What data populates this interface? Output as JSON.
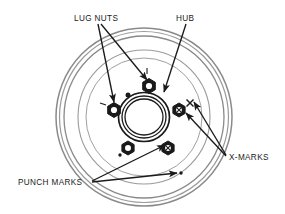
{
  "diagram": {
    "type": "brake-drum-technical-illustration",
    "background_color": "#ffffff",
    "line_color": "#1a1a1a",
    "ring_color": "#8a8a8a",
    "labels": [
      {
        "id": "lug-nuts",
        "text": "LUG NUTS",
        "x": 74,
        "y": 18,
        "anchor": "start",
        "leader_targets": [
          [
            115,
            110
          ],
          [
            150,
            88
          ]
        ]
      },
      {
        "id": "hub",
        "text": "HUB",
        "x": 176,
        "y": 18,
        "anchor": "start",
        "leader_targets": [
          [
            164,
            92
          ]
        ]
      },
      {
        "id": "x-marks",
        "text": "X-MARKS",
        "x": 228,
        "y": 158,
        "anchor": "start",
        "leader_targets": [
          [
            186,
            103
          ],
          [
            178,
            110
          ]
        ]
      },
      {
        "id": "punch-marks",
        "text": "PUNCH MARKS",
        "x": 18,
        "y": 184,
        "anchor": "start",
        "leader_targets": [
          [
            168,
            143
          ],
          [
            178,
            173
          ]
        ]
      }
    ],
    "drum": {
      "center_x": 144,
      "center_y": 117,
      "outer_rings": [
        {
          "rx": 88,
          "ry": 89,
          "stroke": "#8a8a8a",
          "width": 1.4
        },
        {
          "rx": 84,
          "ry": 85,
          "stroke": "#8a8a8a",
          "width": 1.2
        },
        {
          "rx": 79,
          "ry": 80,
          "stroke": "#8a8a8a",
          "width": 1.0
        },
        {
          "rx": 66,
          "ry": 67,
          "stroke": "#8a8a8a",
          "width": 1.0
        },
        {
          "rx": 58,
          "ry": 59,
          "stroke": "#8a8a8a",
          "width": 1.0
        }
      ],
      "hub_rings": [
        {
          "rx": 25,
          "ry": 24,
          "stroke": "#1a1a1a",
          "width": 1.6
        },
        {
          "rx": 22,
          "ry": 21,
          "stroke": "#1a1a1a",
          "width": 1.2
        },
        {
          "rx": 19,
          "ry": 18,
          "stroke": "#1a1a1a",
          "width": 1.2
        }
      ]
    },
    "lug_nuts": [
      {
        "id": "lug-nut-top",
        "x": 149,
        "y": 86,
        "r": 7.2,
        "filled": false
      },
      {
        "id": "lug-nut-left",
        "x": 114,
        "y": 110,
        "r": 7.2,
        "filled": false
      },
      {
        "id": "lug-nut-bottom-left",
        "x": 128,
        "y": 148,
        "r": 7.0,
        "filled": false
      },
      {
        "id": "lug-nut-bottom-right",
        "x": 168,
        "y": 148,
        "r": 7.0,
        "filled": true
      },
      {
        "id": "lug-nut-right",
        "x": 179,
        "y": 110,
        "r": 7.0,
        "filled": true
      }
    ],
    "punch_marks": [
      {
        "id": "punch-mark-top",
        "x": 128,
        "y": 95,
        "r": 2.4
      },
      {
        "id": "punch-mark-lower-left",
        "x": 120,
        "y": 155,
        "r": 1.6
      },
      {
        "id": "punch-mark-lower-right",
        "x": 180,
        "y": 173,
        "r": 1.6
      }
    ],
    "x_marks": [
      {
        "id": "x-mark-right",
        "x": 190,
        "y": 103,
        "size": 5.0
      },
      {
        "id": "x-mark-lug-right",
        "x": 179,
        "y": 110,
        "size": 3.6
      },
      {
        "id": "x-mark-lug-bottom",
        "x": 168,
        "y": 148,
        "size": 3.6
      }
    ],
    "tick_marks": [
      {
        "id": "tick-top",
        "x": 147,
        "y": 71
      },
      {
        "id": "tick-left",
        "x": 103,
        "y": 104
      }
    ]
  }
}
